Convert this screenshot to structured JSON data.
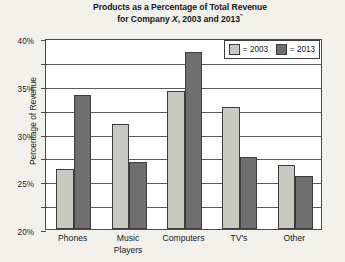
{
  "chart_data": {
    "type": "bar",
    "title": "Products as a Percentage of Total Revenue for Company X, 2003 and 2013\"",
    "title_line1": "Products as a Percentage of Total Revenue",
    "title_line2_pre": "for Company ",
    "title_line2_italic": "X",
    "title_line2_post": ", 2003 and 2013",
    "title_superscript": "\"",
    "xlabel": "",
    "ylabel": "Percentage of Revenue",
    "categories": [
      "Phones",
      "Music\nPlayers",
      "Computers",
      "TV's",
      "Other"
    ],
    "ylim": [
      0,
      40
    ],
    "ytick_labels": [
      "40%",
      "35%",
      "30%",
      "25%",
      "20%",
      "15%",
      "10%",
      "5%",
      "0%"
    ],
    "ytick_values": [
      40,
      35,
      30,
      25,
      20,
      15,
      10,
      5,
      0
    ],
    "grid": true,
    "legend_position": "top-right",
    "series": [
      {
        "name": "2003",
        "legend_label": "= 2003",
        "color": "#c9c9c4",
        "values": [
          12.5,
          22,
          29,
          25.5,
          13.5
        ]
      },
      {
        "name": "2013",
        "legend_label": "= 2013",
        "color": "#6f6f6f",
        "values": [
          28,
          14,
          37,
          15,
          11
        ]
      }
    ]
  },
  "colors": {
    "series_2003": "#c9c9c4",
    "series_2013": "#6f6f6f",
    "axis": "#4a4a4a",
    "plot_background": "#ffffff",
    "page_background": "#f3f1ec"
  }
}
